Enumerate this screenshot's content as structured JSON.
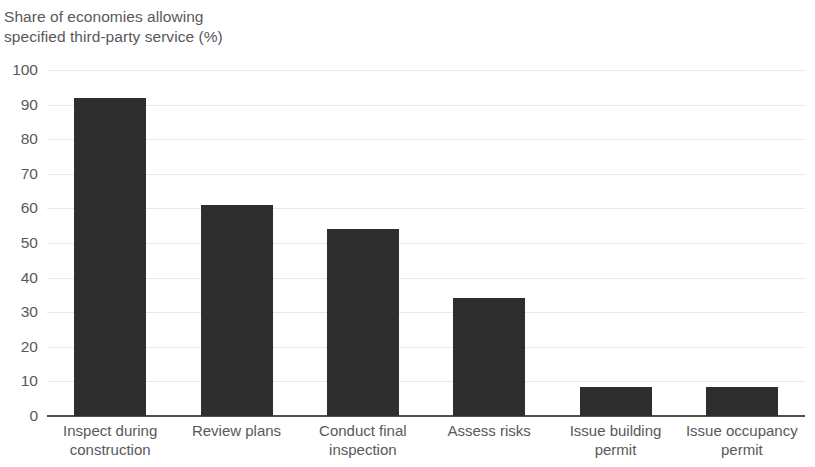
{
  "chart_data": {
    "type": "bar",
    "title": "Share of economies allowing\nspecified third-party service (%)",
    "title_line1": "Share of economies allowing",
    "title_line2": "specified third-party service (%)",
    "xlabel": "",
    "ylabel": "Share of economies allowing specified third-party service (%)",
    "ylim": [
      0,
      100
    ],
    "ytick_step": 10,
    "yticks": [
      100,
      90,
      80,
      70,
      60,
      50,
      40,
      30,
      20,
      10,
      0
    ],
    "ytick_labels": [
      "100",
      "90",
      "80",
      "70",
      "60",
      "50",
      "40",
      "30",
      "20",
      "10",
      "0"
    ],
    "grid": true,
    "legend": false,
    "categories": [
      "Inspect during\nconstruction",
      "Review plans",
      "Conduct final\ninspection",
      "Assess risks",
      "Issue building\npermit",
      "Issue occupancy\npermit"
    ],
    "values": [
      92,
      61,
      54,
      34,
      8.5,
      8.5
    ],
    "bar_color": "#2e2e2e",
    "gridline_color": "#e8e8e8",
    "axis_color": "#4f4f4f",
    "text_color": "#58595b",
    "background_color": "#ffffff"
  }
}
